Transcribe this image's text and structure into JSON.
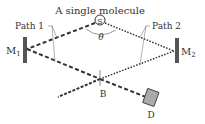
{
  "title": "A single molecule",
  "source_label": "S",
  "angle_label": "θ",
  "paths": [
    {
      "label": "Path 1",
      "style": "dashed"
    },
    {
      "label": "Path 2",
      "style": "dotted"
    }
  ],
  "mirrors": [
    {
      "label": "M",
      "subscript": "1"
    },
    {
      "label": "M",
      "subscript": "2"
    }
  ],
  "beam_splitter_label": "B",
  "detector_label": "D",
  "colors": {
    "line": "#333333",
    "mirror": "#555555",
    "detector": "#aaaaaa"
  }
}
